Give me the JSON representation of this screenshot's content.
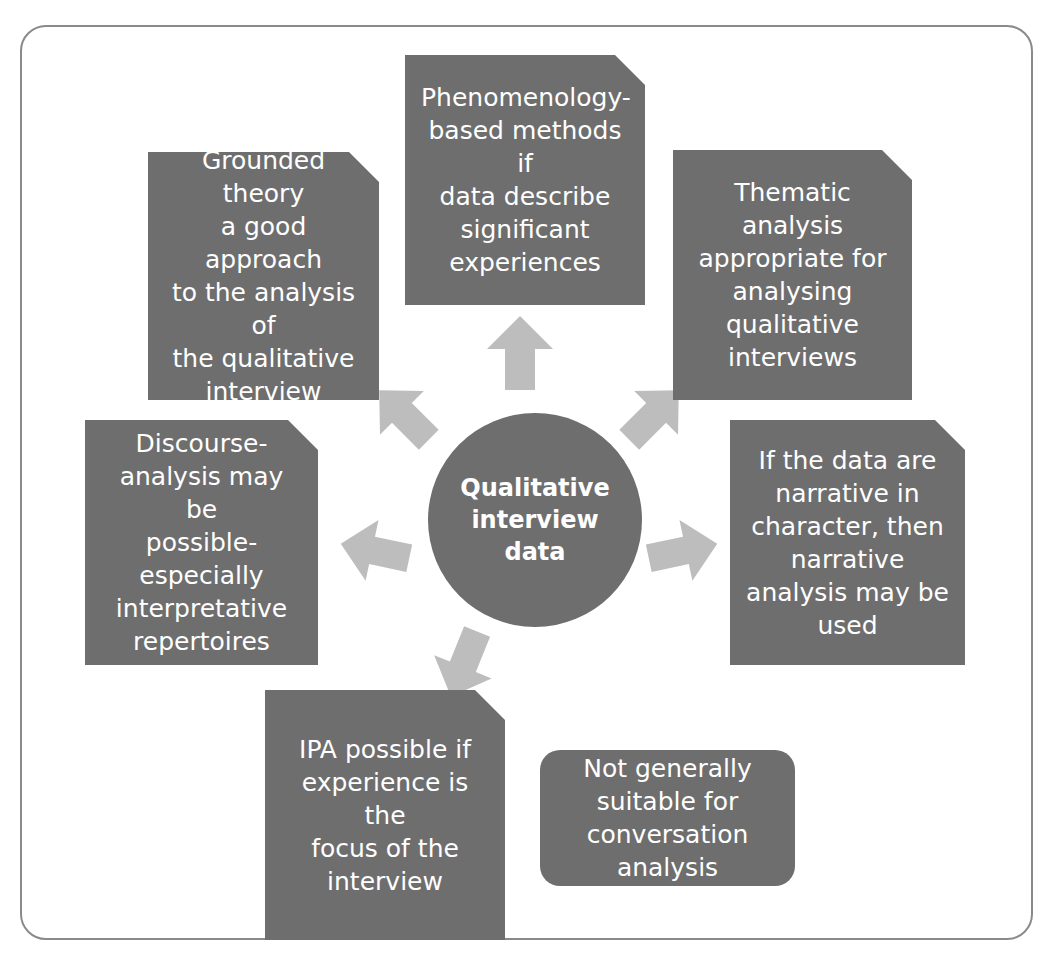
{
  "diagram": {
    "title_hidden": "",
    "frame": {
      "style": "rounded-rectangle-border",
      "color": "#8a8a8a"
    },
    "palette": {
      "node_fill": "#6e6e6e",
      "node_text": "#ffffff",
      "arrow_fill": "#bdbdbd",
      "canvas": "#ffffff",
      "frame_border": "#8a8a8a"
    },
    "hub": {
      "label": "Qualitative\ninterview\ndata",
      "shape": "circle"
    },
    "nodes": [
      {
        "id": "phenomenology",
        "label": "Phenomenology-\nbased methods if\ndata describe\nsignificant\nexperiences",
        "shape": "cut-corner-rectangle",
        "position": "top"
      },
      {
        "id": "grounded-theory",
        "label": "Grounded theory\na good approach\nto the analysis of\nthe qualitative\ninterview",
        "shape": "cut-corner-rectangle",
        "position": "top-left"
      },
      {
        "id": "thematic-analysis",
        "label": "Thematic analysis\nappropriate for\nanalysing\nqualitative\ninterviews",
        "shape": "cut-corner-rectangle",
        "position": "top-right"
      },
      {
        "id": "discourse-analysis",
        "label": "Discourse-\nanalysis may be\npossible-\nespecially\ninterpretative\nrepertoires",
        "shape": "cut-corner-rectangle",
        "position": "middle-left"
      },
      {
        "id": "narrative-analysis",
        "label": "If the data are\nnarrative in\ncharacter, then\nnarrative\nanalysis may be\nused",
        "shape": "cut-corner-rectangle",
        "position": "middle-right"
      },
      {
        "id": "ipa",
        "label": "IPA possible if\nexperience is the\nfocus of the\ninterview",
        "shape": "cut-corner-rectangle",
        "position": "bottom-left"
      },
      {
        "id": "conversation-analysis",
        "label": "Not generally\nsuitable for\nconversation\nanalysis",
        "shape": "rounded-rectangle",
        "position": "bottom-right"
      }
    ],
    "arrows": [
      {
        "id": "arrow-up",
        "direction": "up",
        "to": "phenomenology"
      },
      {
        "id": "arrow-up-left",
        "direction": "up-left",
        "to": "grounded-theory"
      },
      {
        "id": "arrow-up-right",
        "direction": "up-right",
        "to": "thematic-analysis"
      },
      {
        "id": "arrow-left",
        "direction": "left",
        "to": "discourse-analysis"
      },
      {
        "id": "arrow-right",
        "direction": "right",
        "to": "narrative-analysis"
      },
      {
        "id": "arrow-down-left",
        "direction": "down-left",
        "to": "ipa"
      }
    ]
  }
}
